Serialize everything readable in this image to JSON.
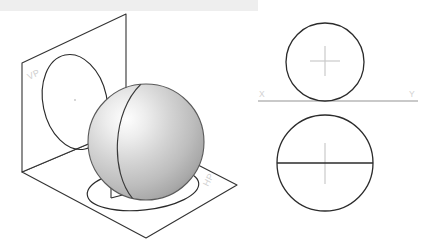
{
  "figure": {
    "title_band_color": "#eeeeee",
    "background_color": "#ffffff",
    "labels": {
      "vertical_plane": "VP",
      "horizontal_plane": "HP",
      "x_axis": "X",
      "y_axis": "Y"
    },
    "stroke_colors": {
      "outline": "#2b2b2b",
      "plane_edge": "#333333",
      "construction": "#c8c8c8",
      "xy_line": "#c9c9c9"
    },
    "sphere": {
      "fill_light": "#fdfdfd",
      "fill_mid": "#c9c9c9",
      "fill_dark": "#9a9a9a",
      "center_x": 146,
      "center_y": 142,
      "radius": 58
    },
    "pictorial": {
      "caption": "Sphere resting on HP in front of VP",
      "vp_plane_points": "22,63 126,14 126,128 22,172",
      "hp_plane_points": "22,172 126,128 237,185 146,238",
      "vp_ellipse": {
        "cx": 75,
        "cy": 102,
        "rx": 32,
        "ry": 48,
        "rotation": -12
      },
      "hp_ellipse": {
        "cx": 143,
        "cy": 189,
        "rx": 56,
        "ry": 21,
        "rotation": -6
      }
    },
    "orthographic": {
      "front_view": {
        "name": "front-view-circle",
        "cx": 325,
        "cy": 62,
        "r": 39,
        "has_center_mark": true,
        "has_diameter_line": false
      },
      "top_view": {
        "name": "top-view-circle",
        "cx": 325,
        "cy": 163,
        "r": 48,
        "has_center_mark": true,
        "has_diameter_line": true
      },
      "xy_line": {
        "x1": 258,
        "x2": 418,
        "y": 101
      }
    }
  }
}
